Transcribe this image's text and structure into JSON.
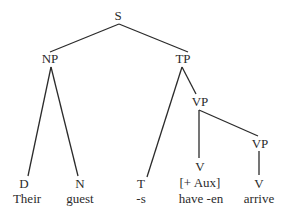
{
  "tree": {
    "root": "S",
    "nodes": {
      "s": "S",
      "np": "NP",
      "tp": "TP",
      "vp1": "VP",
      "vp2": "VP",
      "d": "D",
      "n": "N",
      "t": "T",
      "v1": "V",
      "v1_feature": "[+ Aux]",
      "v2": "V"
    },
    "words": {
      "d": "Their",
      "n": "guest",
      "t": "-s",
      "v1": "have -en",
      "v2": "arrive"
    }
  },
  "colors": {
    "ink": "#2b2b2b",
    "background": "#ffffff"
  }
}
